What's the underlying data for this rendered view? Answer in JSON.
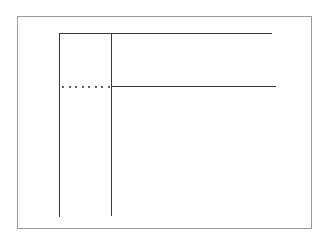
{
  "diagram": {
    "type": "line-structure",
    "frame": {
      "left": 17,
      "top": 16,
      "right": 312,
      "bottom": 229,
      "color": "#9a9a9a"
    },
    "line_color": "#3a3a3a",
    "lines": [
      {
        "id": "top-horizontal",
        "x1": 60,
        "y1": 34,
        "x2": 271,
        "y2": 34,
        "style": "solid"
      },
      {
        "id": "left-vertical",
        "x1": 60,
        "y1": 34,
        "x2": 60,
        "y2": 216,
        "style": "solid"
      },
      {
        "id": "inner-vertical",
        "x1": 112,
        "y1": 34,
        "x2": 112,
        "y2": 215,
        "style": "solid"
      },
      {
        "id": "middle-horizontal",
        "x1": 112,
        "y1": 87,
        "x2": 275,
        "y2": 87,
        "style": "solid"
      },
      {
        "id": "dotted-connector",
        "x1": 62,
        "y1": 87,
        "x2": 110,
        "y2": 87,
        "style": "dotted",
        "dot_count": 8
      }
    ]
  }
}
